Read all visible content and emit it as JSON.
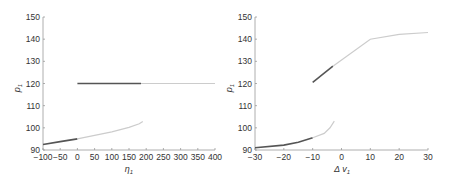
{
  "chart_data": [
    {
      "type": "line",
      "title": "",
      "xlabel": "η1",
      "ylabel": "p1",
      "xlim": [
        -100,
        400
      ],
      "ylim": [
        90,
        150
      ],
      "xticks": [
        -100,
        -50,
        0,
        50,
        100,
        150,
        200,
        250,
        300,
        350,
        400
      ],
      "yticks": [
        90,
        100,
        110,
        120,
        130,
        140,
        150
      ],
      "grid": false,
      "series": [
        {
          "name": "lower-dark",
          "color": "#555555",
          "x": [
            -100,
            -50,
            0
          ],
          "y": [
            92.5,
            93.8,
            95.0
          ]
        },
        {
          "name": "lower-light",
          "color": "#cccccc",
          "x": [
            0,
            50,
            100,
            150,
            180,
            190
          ],
          "y": [
            95.0,
            96.6,
            98.2,
            100.2,
            101.8,
            102.8
          ]
        },
        {
          "name": "upper-dark",
          "color": "#555555",
          "x": [
            0,
            185
          ],
          "y": [
            120,
            120
          ]
        },
        {
          "name": "upper-light",
          "color": "#cccccc",
          "x": [
            185,
            400
          ],
          "y": [
            120,
            120
          ]
        }
      ]
    },
    {
      "type": "line",
      "title": "",
      "xlabel": "Δ v1",
      "ylabel": "p1",
      "xlim": [
        -30,
        30
      ],
      "ylim": [
        90,
        150
      ],
      "xticks": [
        -30,
        -20,
        -10,
        0,
        10,
        20,
        30
      ],
      "yticks": [
        90,
        100,
        110,
        120,
        130,
        140,
        150
      ],
      "grid": false,
      "series": [
        {
          "name": "lower-dark",
          "color": "#555555",
          "x": [
            -30,
            -20,
            -15,
            -10
          ],
          "y": [
            91.0,
            92.2,
            93.5,
            95.5
          ]
        },
        {
          "name": "lower-light",
          "color": "#cccccc",
          "x": [
            -10,
            -6,
            -4,
            -2.5
          ],
          "y": [
            95.5,
            97.5,
            100.0,
            103.0
          ]
        },
        {
          "name": "upper-dark",
          "color": "#555555",
          "x": [
            -10,
            -3
          ],
          "y": [
            120.5,
            127.8
          ]
        },
        {
          "name": "upper-light",
          "color": "#cccccc",
          "x": [
            -3,
            10,
            20,
            30
          ],
          "y": [
            127.8,
            140.0,
            142.2,
            143.0
          ]
        }
      ]
    }
  ],
  "left": {
    "xlabel": "η",
    "xlabel_sub": "1",
    "ylabel": "p",
    "ylabel_sub": "1",
    "yticks": [
      "90",
      "100",
      "110",
      "120",
      "130",
      "140",
      "150"
    ],
    "xticks": [
      "−100",
      "−50",
      "0",
      "50",
      "100",
      "150",
      "200",
      "250",
      "300",
      "350",
      "400"
    ]
  },
  "right": {
    "xlabel": "Δ v",
    "xlabel_sub": "1",
    "ylabel": "p",
    "ylabel_sub": "1",
    "yticks": [
      "90",
      "100",
      "110",
      "120",
      "130",
      "140",
      "150"
    ],
    "xticks": [
      "−30",
      "−20",
      "−10",
      "0",
      "10",
      "20",
      "30"
    ]
  }
}
